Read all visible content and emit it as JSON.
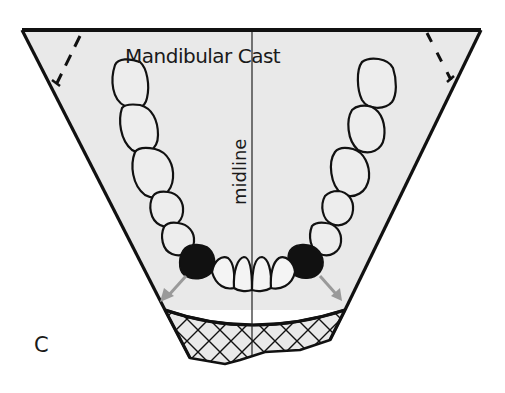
{
  "figure": {
    "title": "Mandibular Cast",
    "midline_label": "midline",
    "panel_label": "C",
    "colors": {
      "background": "#ffffff",
      "cast_fill": "#e9e9e9",
      "outline": "#111111",
      "arrow": "#9a9a9a",
      "dark_tooth": "#111111"
    },
    "elements": {
      "cast_outline": "trapezoid (mandibular cast trimmed base)",
      "dashed_lines": 2,
      "molar_teeth_left": 5,
      "molar_teeth_right": 5,
      "dark_teeth": 2,
      "incisors_canines": 4,
      "arrows": 2,
      "hatched_region": "crosshatched anterior land area"
    }
  }
}
